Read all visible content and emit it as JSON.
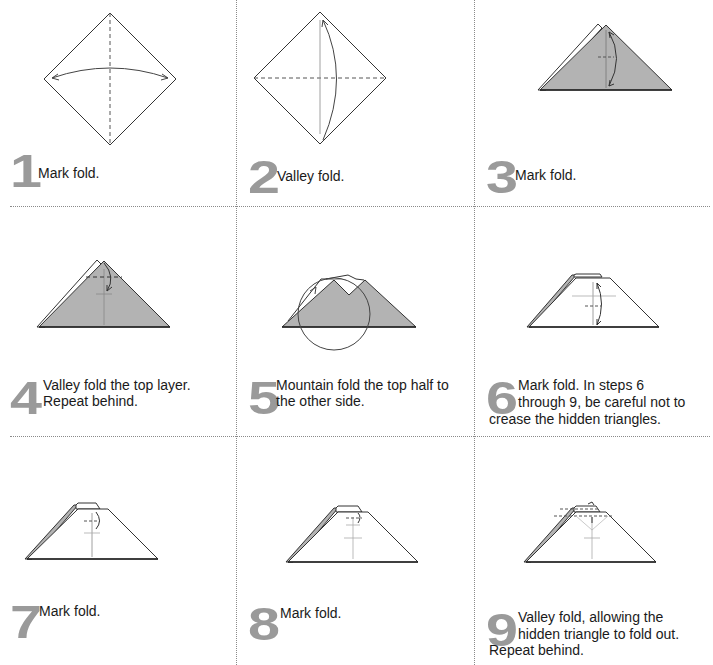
{
  "colors": {
    "paper_fill": "#b3b3b3",
    "line": "#333333",
    "step_number": "#9a9a9a",
    "divider": "#8a8a8a"
  },
  "steps": [
    {
      "number": "1",
      "caption_line1": "Mark fold.",
      "caption_line2": "",
      "caption_line3": ""
    },
    {
      "number": "2",
      "caption_line1": "Valley fold.",
      "caption_line2": "",
      "caption_line3": ""
    },
    {
      "number": "3",
      "caption_line1": "Mark fold.",
      "caption_line2": "",
      "caption_line3": ""
    },
    {
      "number": "4",
      "caption_line1": "Valley fold the top layer.",
      "caption_line2": "Repeat behind.",
      "caption_line3": ""
    },
    {
      "number": "5",
      "caption_line1": "Mountain fold the top half to",
      "caption_line2": "the other side.",
      "caption_line3": ""
    },
    {
      "number": "6",
      "caption_line1": "Mark fold. In steps 6",
      "caption_line2": "through 9, be careful not to",
      "caption_line3": "crease the hidden triangles."
    },
    {
      "number": "7",
      "caption_line1": "Mark fold.",
      "caption_line2": "",
      "caption_line3": ""
    },
    {
      "number": "8",
      "caption_line1": "Mark fold.",
      "caption_line2": "",
      "caption_line3": ""
    },
    {
      "number": "9",
      "caption_line1": "Valley fold, allowing the",
      "caption_line2": "hidden triangle to fold out.",
      "caption_line3": "Repeat behind."
    }
  ]
}
